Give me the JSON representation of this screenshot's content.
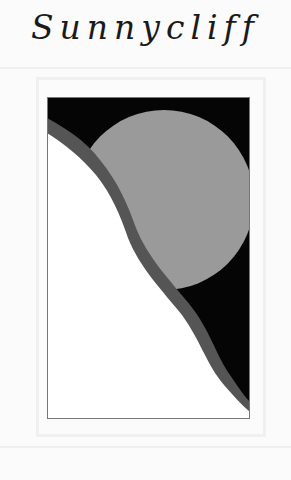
{
  "logo": {
    "title": "Sunnycliff"
  },
  "artwork": {
    "description": "sun over cliff emblem",
    "colors": {
      "sky": "#050505",
      "sun": "#9a9a9a",
      "cliff_band": "#555555",
      "cliff_face": "#ffffff",
      "frame": "#777777"
    }
  }
}
